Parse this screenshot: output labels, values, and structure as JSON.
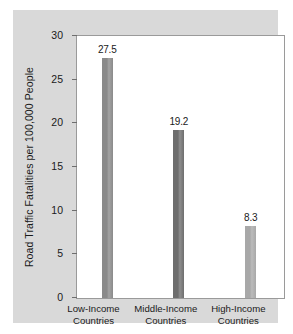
{
  "chart_data": {
    "type": "bar",
    "title": "",
    "subtitle": "",
    "xlabel": "",
    "ylabel": "Road Traffic Fatalities per 100,000 People",
    "ylim": [
      0,
      30
    ],
    "yticks": [
      0,
      5,
      10,
      15,
      20,
      25,
      30
    ],
    "ytick_labels": [
      "0",
      "5",
      "10",
      "15",
      "20",
      "25",
      "30"
    ],
    "grid": false,
    "legend": "none",
    "categories": [
      "Low-Income Countries",
      "Middle-Income Countries",
      "High-Income Countries"
    ],
    "category_lines": [
      [
        "Low-Income",
        "Countries"
      ],
      [
        "Middle-Income",
        "Countries"
      ],
      [
        "High-Income",
        "Countries"
      ]
    ],
    "values": [
      27.5,
      19.2,
      8.3
    ],
    "value_labels": [
      "27.5",
      "19.2",
      "8.3"
    ],
    "bar_colors": [
      "#8a8a8a",
      "#6e6e6e",
      "#a8a8a8"
    ],
    "bar_centers_pct": [
      14.6,
      49.2,
      83.9
    ],
    "bar_width_pct": 5.3
  },
  "figure": {
    "panel_color": "#d9d9d9",
    "plot_background": "#ffffff",
    "axis_color": "#6e6e6e",
    "text_color": "#1a1a1a"
  }
}
